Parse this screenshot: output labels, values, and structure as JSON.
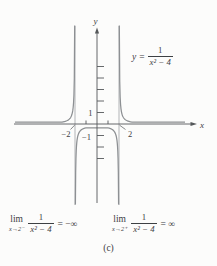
{
  "caption": "(c)",
  "graph": {
    "x_axis_label": "x",
    "y_axis_label": "y",
    "tick_1": "1",
    "tick_neg1": "−1",
    "tick_neg2": "−2",
    "tick_2": "2"
  },
  "equation": {
    "lhs_var": "y",
    "equals": "=",
    "numerator": "1",
    "denominator": "x² − 4"
  },
  "limits": {
    "left": {
      "op": "lim",
      "sub": "x→2⁻",
      "numerator": "1",
      "denominator": "x² − 4",
      "rhs": "= −∞"
    },
    "right": {
      "op": "lim",
      "sub": "x→2⁺",
      "numerator": "1",
      "denominator": "x² − 4",
      "rhs": "= ∞"
    }
  },
  "colors": {
    "curve": "#8d9093",
    "asymptote": "#aaadaf",
    "axis": "#55585a",
    "text": "#3d4043",
    "background": "#fcfcfb"
  },
  "chart_data": {
    "type": "line",
    "function_label": "y = 1/(x² − 4)",
    "expression": "1/(x^2 - 4)",
    "vertical_asymptotes": [
      -2,
      2
    ],
    "horizontal_asymptote_y": 0,
    "x_axis_label": "x",
    "y_axis_label": "y",
    "labeled_x_ticks": [
      -2,
      2
    ],
    "labeled_y_ticks": [
      1,
      -1
    ],
    "x_minor_ticks": [
      -1,
      1
    ],
    "y_minor_ticks": [
      1,
      2,
      3,
      4,
      5,
      -1,
      -2,
      -3
    ],
    "xlim": [
      -7.5,
      8.8
    ],
    "ylim": [
      -7.1,
      8.6
    ],
    "grid": false,
    "branches": [
      {
        "x_range": [
          -7.45,
          -2.029
        ],
        "description": "y → 0⁺ as x → −∞; y → ∞ as x → −2⁻"
      },
      {
        "x_range": [
          -1.964,
          1.964
        ],
        "description": "local maximum at (0, −0.25); y → −∞ as x → −2⁺ and as x → 2⁻"
      },
      {
        "x_range": [
          2.029,
          8.0
        ],
        "description": "y → ∞ as x → 2⁺; y → 0⁺ as x → ∞"
      }
    ],
    "key_points": [
      {
        "x": 0,
        "y": -0.25,
        "note": "top of middle branch"
      }
    ],
    "sample_points": [
      [
        -4,
        0.083
      ],
      [
        -3,
        0.2
      ],
      [
        -2.2,
        1.19
      ],
      [
        -1,
        -0.333
      ],
      [
        0,
        -0.25
      ],
      [
        1,
        -0.333
      ],
      [
        2.2,
        1.19
      ],
      [
        3,
        0.2
      ],
      [
        4,
        0.083
      ]
    ],
    "stated_limits": [
      {
        "expression": "lim x→2⁻ 1/(x²−4)",
        "value": "−∞"
      },
      {
        "expression": "lim x→2⁺ 1/(x²−4)",
        "value": "∞"
      }
    ]
  }
}
